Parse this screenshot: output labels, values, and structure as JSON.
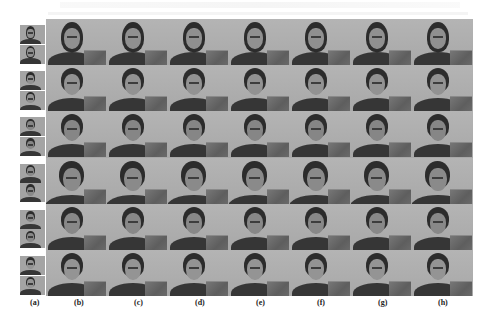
{
  "figure": {
    "columns": [
      {
        "id": "a",
        "label": "(a)",
        "x": 30
      },
      {
        "id": "b",
        "label": "(b)",
        "x": 74
      },
      {
        "id": "c",
        "label": "(c)",
        "x": 134
      },
      {
        "id": "d",
        "label": "(d)",
        "x": 195
      },
      {
        "id": "e",
        "label": "(e)",
        "x": 256
      },
      {
        "id": "f",
        "label": "(f)",
        "x": 317
      },
      {
        "id": "g",
        "label": "(g)",
        "x": 378
      },
      {
        "id": "h",
        "label": "(h)",
        "x": 438
      }
    ],
    "rows": [
      {
        "subject": "female-long-hair",
        "hair": "long",
        "skin": "#909090"
      },
      {
        "subject": "female-hair-back",
        "hair": "back",
        "skin": "#929292"
      },
      {
        "subject": "male-short-hair",
        "hair": "short",
        "skin": "#868686"
      },
      {
        "subject": "male-short-hair-close",
        "hair": "short",
        "skin": "#8a8a8a"
      },
      {
        "subject": "male-dark-hair",
        "hair": "short",
        "skin": "#888888"
      },
      {
        "subject": "female-hair-tied",
        "hair": "back",
        "skin": "#949494"
      }
    ],
    "grid": {
      "result_columns": 7,
      "rows": 6
    }
  },
  "colors": {
    "background": "#ffffff",
    "cell_bg": "#b0b0b0",
    "hair": "#2c2c2c",
    "label": "#222222"
  }
}
